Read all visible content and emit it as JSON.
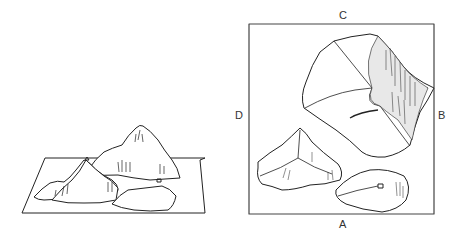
{
  "figure": {
    "left_panel": {
      "description": "Three-dimensional mountain landscape model on a flat base"
    },
    "right_panel": {
      "description": "Top-down view of the mountain model inside a square frame",
      "labels": {
        "top": "C",
        "right": "B",
        "bottom": "A",
        "left": "D"
      }
    }
  }
}
